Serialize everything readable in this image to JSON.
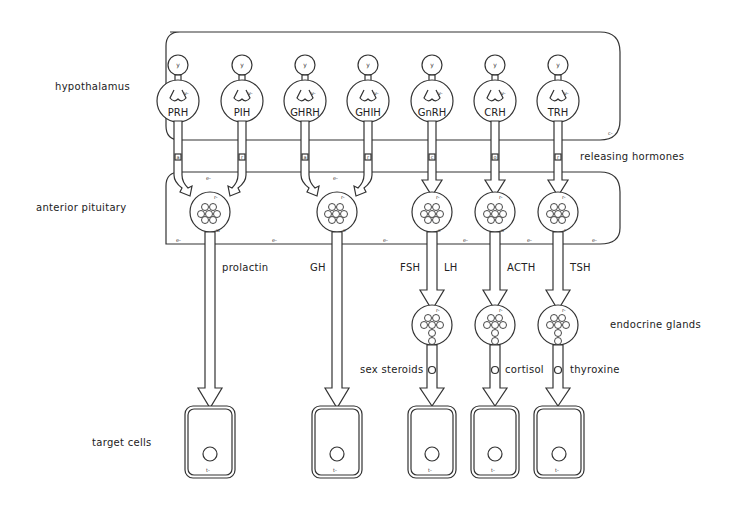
{
  "levels": {
    "hypothalamus": "hypothalamus",
    "releasing": "releasing  hormones",
    "pituitary": "anterior  pituitary",
    "endocrine": "endocrine  glands",
    "target": "target  cells"
  },
  "region_marks": {
    "hypo_corner": "c-",
    "pit_e": "e-",
    "cell_t": "t-",
    "cell_corner": "t",
    "y": "y",
    "v": "v-",
    "r": "r-"
  },
  "releasing_hormones": [
    "PRH",
    "PIH",
    "GHRH",
    "GHIH",
    "GnRH",
    "CRH",
    "TRH"
  ],
  "stalk_marks": [
    "a",
    "r",
    "a",
    "r",
    "c",
    "o",
    "r"
  ],
  "pituitary_cell_marks": [
    "w",
    "e",
    "c",
    "o",
    "r"
  ],
  "pituitary_hormones": {
    "prolactin": "prolactin",
    "gh": "GH",
    "fsh": "FSH",
    "lh": "LH",
    "acth": "ACTH",
    "tsh": "TSH"
  },
  "gland_hormones": {
    "sex": "sex  steroids",
    "cortisol": "cortisol",
    "thyroxine": "thyroxine"
  }
}
